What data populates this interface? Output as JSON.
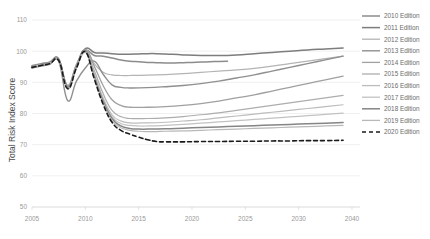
{
  "chart_data": {
    "type": "line",
    "title": "",
    "xlabel": "",
    "ylabel": "Total Risk Index Score",
    "xlim": [
      2005,
      2041
    ],
    "ylim": [
      50,
      110
    ],
    "ytick_values": [
      110,
      100,
      90,
      80,
      70,
      60,
      50
    ],
    "ytick_labels": [
      "110",
      "100",
      "90",
      "80",
      "70",
      "60",
      "50"
    ],
    "xtick_values": [
      2005,
      2010,
      2015,
      2020,
      2025,
      2030,
      2040
    ],
    "xtick_labels": [
      "2005",
      "2010",
      "2015",
      "2020",
      "2025",
      "2030",
      "2040"
    ],
    "grid": "horizontal",
    "legend_position": "right",
    "series": [
      {
        "name": "2010 Edition",
        "color": "#8c8c8c",
        "width": 1.5,
        "dash": "none",
        "x": [
          2005,
          2006,
          2007,
          2008,
          2009,
          2010,
          2011,
          2012,
          2013,
          2014,
          2015,
          2016,
          2017,
          2018,
          2019,
          2020,
          2021,
          2022,
          2023,
          2024,
          2025,
          2026,
          2027
        ],
        "values": [
          95.0,
          95.6,
          96.2,
          97.3,
          89.0,
          95.5,
          100.2,
          98.6,
          98.4,
          97.8,
          97.2,
          96.8,
          96.6,
          96.4,
          96.3,
          96.2,
          96.2,
          96.3,
          96.4,
          96.5,
          96.6,
          96.7,
          96.8
        ]
      },
      {
        "name": "2011 Edition",
        "color": "#7d7d7d",
        "width": 1.5,
        "dash": "none",
        "x": [
          2005,
          2006,
          2007,
          2008,
          2009,
          2010,
          2011,
          2012,
          2013,
          2014,
          2015,
          2016,
          2017,
          2018,
          2019,
          2020,
          2022,
          2024,
          2026,
          2028,
          2030,
          2032,
          2034,
          2036,
          2038,
          2040
        ],
        "values": [
          94.8,
          95.4,
          96.0,
          97.1,
          88.6,
          95.2,
          100.8,
          99.6,
          99.4,
          99.2,
          99.0,
          99.0,
          99.1,
          99.2,
          99.2,
          99.1,
          98.8,
          98.6,
          98.6,
          98.8,
          99.2,
          99.6,
          100.0,
          100.4,
          100.7,
          101.0
        ]
      },
      {
        "name": "2012 Edition",
        "color": "#b4b4b4",
        "width": 1.2,
        "dash": "none",
        "x": [
          2005,
          2006,
          2007,
          2008,
          2009,
          2010,
          2011,
          2012,
          2013,
          2014,
          2015,
          2016,
          2018,
          2020,
          2022,
          2024,
          2026,
          2028,
          2030,
          2032,
          2034,
          2036,
          2038,
          2040
        ],
        "values": [
          95.2,
          95.8,
          96.4,
          97.5,
          88.4,
          95.8,
          100.4,
          96.0,
          93.2,
          92.4,
          92.2,
          92.2,
          92.3,
          92.5,
          92.8,
          93.2,
          93.6,
          94.0,
          94.5,
          95.2,
          96.0,
          96.8,
          97.6,
          98.4
        ]
      },
      {
        "name": "2013 Edition",
        "color": "#8f8f8f",
        "width": 1.4,
        "dash": "none",
        "x": [
          2005,
          2006,
          2007,
          2008,
          2009,
          2010,
          2011,
          2012,
          2013,
          2014,
          2015,
          2016,
          2018,
          2020,
          2022,
          2024,
          2026,
          2028,
          2030,
          2032,
          2034,
          2036,
          2038,
          2040
        ],
        "values": [
          94.6,
          95.2,
          95.8,
          96.8,
          84.2,
          90.4,
          94.6,
          96.8,
          92.6,
          89.2,
          88.4,
          88.2,
          88.3,
          88.6,
          89.0,
          89.6,
          90.4,
          91.4,
          92.4,
          93.6,
          94.8,
          96.0,
          97.2,
          98.4
        ]
      },
      {
        "name": "2014 Edition",
        "color": "#a0a0a0",
        "width": 1.3,
        "dash": "none",
        "x": [
          2005,
          2006,
          2007,
          2008,
          2009,
          2010,
          2011,
          2012,
          2013,
          2014,
          2015,
          2016,
          2018,
          2020,
          2022,
          2024,
          2026,
          2028,
          2030,
          2032,
          2034,
          2036,
          2038,
          2040
        ],
        "values": [
          95.4,
          96.0,
          96.6,
          97.6,
          88.8,
          95.4,
          100.6,
          95.2,
          89.0,
          84.4,
          82.6,
          82.0,
          82.0,
          82.2,
          82.6,
          83.2,
          84.0,
          85.0,
          86.0,
          87.2,
          88.4,
          89.6,
          90.8,
          92.0
        ]
      },
      {
        "name": "2015 Edition",
        "color": "#adadad",
        "width": 1.2,
        "dash": "none",
        "x": [
          2005,
          2006,
          2007,
          2008,
          2009,
          2010,
          2011,
          2012,
          2013,
          2014,
          2015,
          2016,
          2018,
          2020,
          2022,
          2024,
          2026,
          2028,
          2030,
          2032,
          2034,
          2036,
          2038,
          2040
        ],
        "values": [
          95.0,
          95.6,
          96.2,
          97.2,
          88.2,
          95.0,
          100.0,
          93.8,
          86.4,
          81.0,
          79.0,
          78.4,
          78.4,
          78.6,
          79.0,
          79.6,
          80.2,
          81.0,
          81.8,
          82.6,
          83.4,
          84.2,
          85.0,
          85.8
        ]
      },
      {
        "name": "2016 Edition",
        "color": "#bcbcbc",
        "width": 1.2,
        "dash": "none",
        "x": [
          2005,
          2006,
          2007,
          2008,
          2009,
          2010,
          2011,
          2012,
          2013,
          2014,
          2015,
          2016,
          2018,
          2020,
          2022,
          2024,
          2026,
          2028,
          2030,
          2032,
          2034,
          2036,
          2038,
          2040
        ],
        "values": [
          94.9,
          95.5,
          96.1,
          97.0,
          87.8,
          94.6,
          99.6,
          92.8,
          85.0,
          79.6,
          77.6,
          77.0,
          77.0,
          77.2,
          77.6,
          78.0,
          78.6,
          79.2,
          79.8,
          80.4,
          81.0,
          81.6,
          82.2,
          82.8
        ]
      },
      {
        "name": "2017 Edition",
        "color": "#c2c2c2",
        "width": 1.2,
        "dash": "none",
        "x": [
          2005,
          2006,
          2007,
          2008,
          2009,
          2010,
          2011,
          2012,
          2013,
          2014,
          2015,
          2016,
          2017,
          2018,
          2020,
          2022,
          2024,
          2026,
          2028,
          2030,
          2032,
          2034,
          2036,
          2038,
          2040
        ],
        "values": [
          95.1,
          95.7,
          96.3,
          97.2,
          88.0,
          94.8,
          99.8,
          92.4,
          84.6,
          79.0,
          76.8,
          76.2,
          76.0,
          76.0,
          76.2,
          76.5,
          76.9,
          77.3,
          77.7,
          78.1,
          78.5,
          78.9,
          79.3,
          79.7,
          80.1
        ]
      },
      {
        "name": "2018 Edition",
        "color": "#858585",
        "width": 1.5,
        "dash": "none",
        "x": [
          2005,
          2006,
          2007,
          2008,
          2009,
          2010,
          2011,
          2012,
          2013,
          2014,
          2015,
          2016,
          2017,
          2018,
          2020,
          2022,
          2024,
          2026,
          2028,
          2030,
          2032,
          2034,
          2036,
          2038,
          2040
        ],
        "values": [
          95.2,
          95.8,
          96.4,
          97.4,
          88.4,
          95.0,
          100.2,
          92.0,
          84.0,
          78.4,
          76.0,
          75.2,
          75.0,
          75.0,
          75.1,
          75.3,
          75.5,
          75.7,
          75.9,
          76.1,
          76.3,
          76.5,
          76.7,
          76.9,
          77.1
        ]
      },
      {
        "name": "2019 Edition",
        "color": "#b8b8b8",
        "width": 1.2,
        "dash": "none",
        "x": [
          2005,
          2006,
          2007,
          2008,
          2009,
          2010,
          2011,
          2012,
          2013,
          2014,
          2015,
          2016,
          2017,
          2018,
          2019,
          2020,
          2022,
          2024,
          2026,
          2028,
          2030,
          2032,
          2034,
          2036,
          2038,
          2040
        ],
        "values": [
          95.0,
          95.6,
          96.2,
          97.1,
          88.1,
          94.7,
          99.9,
          91.6,
          83.4,
          77.8,
          75.4,
          74.6,
          74.3,
          74.2,
          74.2,
          74.3,
          74.4,
          74.6,
          74.8,
          75.0,
          75.2,
          75.4,
          75.6,
          75.8,
          76.0,
          76.2
        ]
      },
      {
        "name": "2020 Edition",
        "color": "#1a1a1a",
        "width": 1.6,
        "dash": "4,3",
        "x": [
          2005,
          2006,
          2007,
          2008,
          2009,
          2010,
          2011,
          2012,
          2013,
          2014,
          2015,
          2016,
          2017,
          2018,
          2019,
          2020,
          2022,
          2024,
          2026,
          2028,
          2030,
          2032,
          2034,
          2036,
          2038,
          2040
        ],
        "values": [
          94.8,
          95.4,
          96.0,
          97.0,
          88.0,
          94.6,
          99.8,
          91.2,
          83.0,
          77.2,
          74.6,
          73.4,
          72.4,
          71.6,
          71.0,
          70.9,
          70.9,
          71.0,
          71.0,
          71.1,
          71.1,
          71.2,
          71.2,
          71.3,
          71.3,
          71.4
        ]
      }
    ]
  },
  "legend": {
    "items": [
      {
        "label": "2010 Edition"
      },
      {
        "label": "2011 Edition"
      },
      {
        "label": "2012 Edition"
      },
      {
        "label": "2013 Edition"
      },
      {
        "label": "2014 Edition"
      },
      {
        "label": "2015 Edition"
      },
      {
        "label": "2016 Edition"
      },
      {
        "label": "2017 Edition"
      },
      {
        "label": "2018 Edition"
      },
      {
        "label": "2019 Edition"
      },
      {
        "label": "2020 Edition"
      }
    ]
  }
}
